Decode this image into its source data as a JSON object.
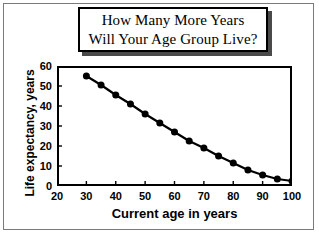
{
  "figure": {
    "background_color": "#ffffff",
    "frame_color": "#7a7a7a",
    "axis_color": "#000000",
    "series_color": "#000000",
    "title_shadow_color": "#4a4a4a"
  },
  "title": {
    "line1": "How Many More Years",
    "line2": "Will Your Age Group Live?"
  },
  "chart_data": {
    "type": "line",
    "title": "How Many More Years Will Your Age Group Live?",
    "xlabel": "Current age in years",
    "ylabel": "Life expectancy, years",
    "xlim": [
      20,
      100
    ],
    "ylim": [
      0,
      60
    ],
    "xticks": [
      20,
      30,
      40,
      50,
      60,
      70,
      80,
      90,
      100
    ],
    "yticks": [
      0,
      10,
      20,
      30,
      40,
      50,
      60
    ],
    "grid": false,
    "legend": false,
    "marker": "filled-circle",
    "x": [
      30,
      35,
      40,
      45,
      50,
      55,
      60,
      65,
      70,
      75,
      80,
      85,
      90,
      95,
      100
    ],
    "values": [
      55,
      50.5,
      45.5,
      41,
      36,
      31.5,
      27,
      22.5,
      19,
      15,
      11.5,
      8,
      5.5,
      3.5,
      2.5
    ],
    "series": [
      {
        "name": "Life expectancy",
        "values": [
          55,
          50.5,
          45.5,
          41,
          36,
          31.5,
          27,
          22.5,
          19,
          15,
          11.5,
          8,
          5.5,
          3.5,
          2.5
        ]
      }
    ]
  }
}
